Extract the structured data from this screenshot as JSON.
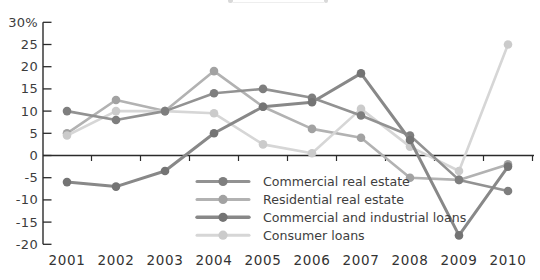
{
  "chart_data": {
    "type": "line",
    "title": "",
    "unit": "%",
    "x": [
      2001,
      2002,
      2003,
      2004,
      2005,
      2006,
      2007,
      2008,
      2009,
      2010
    ],
    "ylim": [
      -20,
      30
    ],
    "yticks": [
      30,
      25,
      20,
      15,
      10,
      5,
      0,
      -5,
      -10,
      -15,
      -20
    ],
    "ytick_labels": [
      "30%",
      "25",
      "20",
      "15",
      "10",
      "5",
      "0",
      "-5",
      "-10",
      "-15",
      "-20"
    ],
    "grid": false,
    "legend_position": "inside-bottom-center",
    "axis_color": "#2b2b2b",
    "label_color": "#3c3c3c",
    "series": [
      {
        "name": "Commercial real estate",
        "line_color": "#929292",
        "dot_color": "#7e7e7e",
        "width": 2.6,
        "values": [
          10,
          8,
          10,
          14,
          15,
          13,
          9,
          4.5,
          -5.5,
          -8
        ]
      },
      {
        "name": "Residential real estate",
        "line_color": "#b2b2b2",
        "dot_color": "#a2a2a2",
        "width": 2.6,
        "values": [
          5,
          12.5,
          10,
          19,
          11,
          6,
          4,
          -5,
          -5.5,
          -2
        ]
      },
      {
        "name": "Commercial and industrial loans",
        "line_color": "#888888",
        "dot_color": "#747474",
        "width": 3,
        "values": [
          -6,
          -7,
          -3.5,
          5,
          11,
          12,
          18.5,
          3.5,
          -18,
          -2.5
        ]
      },
      {
        "name": "Consumer loans",
        "line_color": "#d6d6d6",
        "dot_color": "#cbcbcb",
        "width": 2.6,
        "values": [
          4.5,
          10,
          10,
          9.5,
          2.5,
          0.5,
          10.5,
          2,
          -3.5,
          25
        ]
      }
    ]
  }
}
